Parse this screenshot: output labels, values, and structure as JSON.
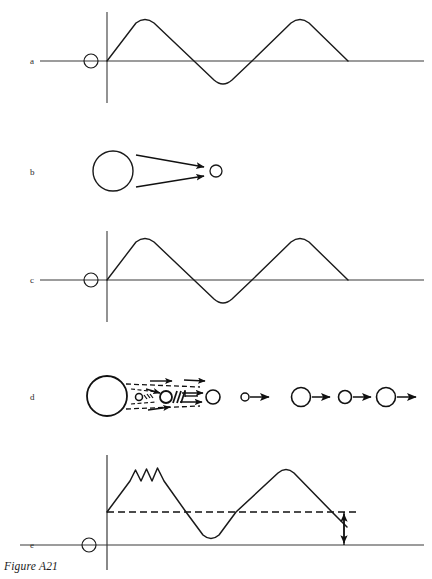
{
  "figure": {
    "caption": "Figure A21",
    "top_fragment": "",
    "width": 432,
    "height": 579,
    "background": "#ffffff",
    "stroke_color": "#1a1a1a",
    "axis_color": "#3a3a3a"
  },
  "panels": [
    {
      "id": "a",
      "label": "a",
      "label_x": 33,
      "label_y": 64,
      "type": "waveform",
      "description": "triangular wave with rounded peaks on an axis, open circle marker left of origin",
      "axis_y": 61,
      "axis_x0": 40,
      "axis_x1": 424,
      "y_axis_x": 107,
      "y_axis_top": 12,
      "y_axis_bottom": 103,
      "marker_circle": {
        "cx": 91,
        "cy": 61,
        "r": 7
      },
      "wave_path": "M107,61 L136,23 Q145,16 154,23 L194,61 L214,80 Q223,88 232,80 L252,61 L291,23 Q300,16 309,23 L348,61",
      "peak_y": 18,
      "trough_y": 86
    },
    {
      "id": "b",
      "label": "b",
      "label_x": 33,
      "label_y": 175,
      "type": "two-body-diagram",
      "description": "large open circle with two solid arrows converting to a small open circle",
      "large_circle": {
        "cx": 113,
        "cy": 171,
        "r": 20
      },
      "small_circle": {
        "cx": 216,
        "cy": 171,
        "r": 6
      },
      "arrows": [
        {
          "x1": 136,
          "y1": 155,
          "x2": 207,
          "y2": 168
        },
        {
          "x1": 136,
          "y1": 187,
          "x2": 207,
          "y2": 175
        }
      ]
    },
    {
      "id": "c",
      "label": "c",
      "label_x": 33,
      "label_y": 283,
      "type": "waveform",
      "description": "triangular wave with rounded peaks on an axis, open circle marker left of origin",
      "axis_y": 280,
      "axis_x0": 40,
      "axis_x1": 424,
      "y_axis_x": 107,
      "y_axis_top": 231,
      "y_axis_bottom": 322,
      "marker_circle": {
        "cx": 91,
        "cy": 280,
        "r": 7
      },
      "wave_path": "M107,280 L136,242 Q145,235 154,242 L194,280 L214,299 Q223,307 232,299 L252,280 L291,242 Q300,235 309,242 L348,280",
      "peak_y": 237,
      "trough_y": 305
    },
    {
      "id": "d",
      "label": "d",
      "label_x": 33,
      "label_y": 400,
      "type": "collision-sequence",
      "description": "large circle emitting dashed cone to small hatched bodies and arrows, followed by four circle-and-arrow pairs",
      "large_circle": {
        "cx": 107,
        "cy": 396,
        "r": 20
      },
      "tiny_circle": {
        "cx": 139,
        "cy": 397,
        "r": 3.5
      },
      "hatched_circle": {
        "cx": 166,
        "cy": 397,
        "r": 6
      },
      "end_circle": {
        "cx": 213,
        "cy": 397,
        "r": 7
      },
      "dashed_cone": [
        {
          "x1": 125,
          "y1": 383,
          "x2": 207,
          "y2": 388
        },
        {
          "x1": 125,
          "y1": 410,
          "x2": 207,
          "y2": 406
        }
      ],
      "sequence": [
        {
          "circle_cx": 245,
          "circle_cy": 397,
          "circle_r": 4,
          "arrow_x1": 252,
          "arrow_x2": 272
        },
        {
          "circle_cx": 301,
          "circle_cy": 397,
          "circle_r": 9,
          "arrow_x1": 312,
          "arrow_x2": 333
        },
        {
          "circle_cx": 345,
          "circle_cy": 397,
          "circle_r": 6.5,
          "arrow_x1": 354,
          "arrow_x2": 374
        },
        {
          "circle_cx": 386,
          "circle_cy": 397,
          "circle_r": 9,
          "arrow_x1": 397,
          "arrow_x2": 419
        }
      ]
    },
    {
      "id": "e",
      "label": "e",
      "label_x": 33,
      "label_y": 548,
      "type": "waveform-offset",
      "description": "triangular wave with small ripples on first peak, dashed offset baseline and a vertical double-headed arrow measuring the offset",
      "axis_y": 545,
      "axis_x0": 20,
      "axis_x1": 424,
      "y_axis_x": 107,
      "y_axis_top": 455,
      "y_axis_bottom": 570,
      "marker_circle": {
        "cx": 89,
        "cy": 545,
        "r": 7
      },
      "dashed_baseline_y": 512,
      "dashed_baseline_x0": 107,
      "dashed_baseline_x1": 360,
      "ripple_count": 3,
      "wave_path": "M107,512 L130,481 L136,470 L141,481 L147,469 L152,481 L158,468 L164,481 L186,512 L203,535 Q211,542 219,535 L236,512 L278,473 Q286,466 294,473 L332,512 L347,527",
      "measure_arrow": {
        "x": 344,
        "y_top": 512,
        "y_bottom": 545
      }
    }
  ]
}
